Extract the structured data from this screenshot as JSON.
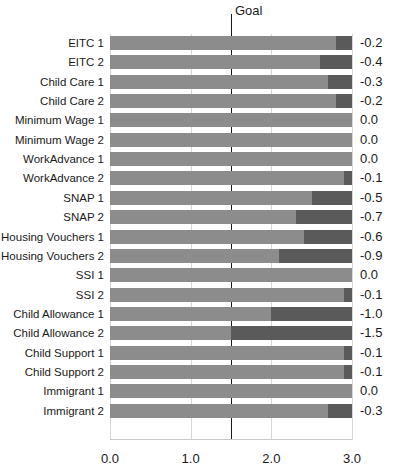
{
  "chart_data": {
    "type": "bar",
    "orientation": "horizontal",
    "stacked": true,
    "title": "",
    "xlabel": "",
    "ylabel": "",
    "xlim": [
      0.0,
      3.0
    ],
    "xticks": [
      "0.0",
      "1.0",
      "2.0",
      "3.0"
    ],
    "xtick_values": [
      0.0,
      1.0,
      2.0,
      3.0
    ],
    "grid": true,
    "legend_position": "none",
    "annotations": [
      {
        "name": "goal",
        "label": "Goal",
        "x_value": 1.5
      }
    ],
    "series": [
      {
        "name": "light-segment",
        "color": "#8c8c8c"
      },
      {
        "name": "dark-segment",
        "color": "#5a5a5a"
      }
    ],
    "bar_total": 3.0,
    "categories": [
      "EITC 1",
      "EITC 2",
      "Child Care 1",
      "Child Care 2",
      "Minimum Wage 1",
      "Minimum Wage 2",
      "WorkAdvance 1",
      "WorkAdvance 2",
      "SNAP 1",
      "SNAP 2",
      "Housing Vouchers 1",
      "Housing Vouchers 2",
      "SSI 1",
      "SSI 2",
      "Child Allowance 1",
      "Child Allowance 2",
      "Child Support 1",
      "Child Support 2",
      "Immigrant 1",
      "Immigrant 2"
    ],
    "values": [
      -0.2,
      -0.4,
      -0.3,
      -0.2,
      0.0,
      0.0,
      0.0,
      -0.1,
      -0.5,
      -0.7,
      -0.6,
      -0.9,
      0.0,
      -0.1,
      -1.0,
      -1.5,
      -0.1,
      -0.1,
      0.0,
      -0.3
    ],
    "value_labels": [
      "-0.2",
      "-0.4",
      "-0.3",
      "-0.2",
      "0.0",
      "0.0",
      "0.0",
      "-0.1",
      "-0.5",
      "-0.7",
      "-0.6",
      "-0.9",
      "0.0",
      "-0.1",
      "-1.0",
      "-1.5",
      "-0.1",
      "-0.1",
      "0.0",
      "-0.3"
    ],
    "light_segment_values": [
      2.8,
      2.6,
      2.7,
      2.8,
      3.0,
      3.0,
      3.0,
      2.9,
      2.5,
      2.3,
      2.4,
      2.1,
      3.0,
      2.9,
      2.0,
      1.5,
      2.9,
      2.9,
      3.0,
      2.7
    ],
    "dark_segment_values": [
      0.2,
      0.4,
      0.3,
      0.2,
      0.0,
      0.0,
      0.0,
      0.1,
      0.5,
      0.7,
      0.6,
      0.9,
      0.0,
      0.1,
      1.0,
      1.5,
      0.1,
      0.1,
      0.0,
      0.3
    ]
  },
  "colors": {
    "light_bar": "#8c8c8c",
    "dark_bar": "#5a5a5a",
    "goal_line": "#1a1a1a",
    "gridline": "#d7d7d7",
    "text": "#1a1a1a",
    "background": "#ffffff"
  }
}
